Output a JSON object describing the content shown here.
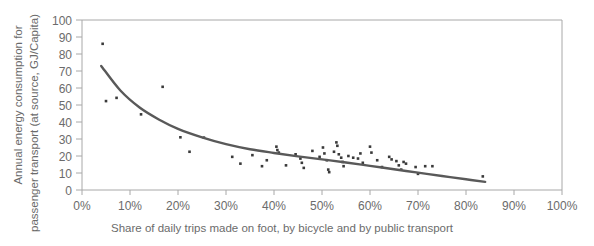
{
  "chart_data": {
    "type": "scatter",
    "title": "",
    "xlabel": "Share of daily trips made on foot, by bicycle and by public transport",
    "ylabel_line1": "Annual energy consumption for",
    "ylabel_line2": "passenger transport (at source, GJ/Capita)",
    "xlim": [
      0,
      100
    ],
    "ylim": [
      0,
      100
    ],
    "xticks": [
      0,
      10,
      20,
      30,
      40,
      50,
      60,
      70,
      80,
      90,
      100
    ],
    "xtick_labels": [
      "0%",
      "10%",
      "20%",
      "30%",
      "40%",
      "50%",
      "60%",
      "70%",
      "80%",
      "90%",
      "100%"
    ],
    "yticks": [
      0,
      10,
      20,
      30,
      40,
      50,
      60,
      70,
      80,
      90,
      100
    ],
    "ytick_labels": [
      "0",
      "10",
      "20",
      "30",
      "40",
      "50",
      "60",
      "70",
      "80",
      "90",
      "100"
    ],
    "grid": false,
    "legend": null,
    "point_color": "#3a3a3a",
    "trend_color": "#595959",
    "axis_color": "#a8a8a8",
    "points": [
      [
        4.3,
        86.0
      ],
      [
        5.0,
        52.3
      ],
      [
        7.2,
        54.2
      ],
      [
        12.3,
        44.5
      ],
      [
        16.8,
        60.7
      ],
      [
        20.5,
        31.0
      ],
      [
        22.4,
        22.5
      ],
      [
        25.4,
        30.8
      ],
      [
        31.3,
        19.5
      ],
      [
        33.0,
        15.5
      ],
      [
        35.5,
        20.5
      ],
      [
        37.5,
        14.0
      ],
      [
        38.5,
        17.5
      ],
      [
        40.5,
        25.5
      ],
      [
        40.7,
        23.5
      ],
      [
        41.0,
        22.0
      ],
      [
        42.5,
        14.5
      ],
      [
        44.5,
        21.0
      ],
      [
        45.5,
        18.5
      ],
      [
        45.8,
        16.0
      ],
      [
        46.2,
        13.0
      ],
      [
        48.0,
        23.0
      ],
      [
        49.5,
        19.5
      ],
      [
        50.2,
        25.0
      ],
      [
        50.5,
        21.5
      ],
      [
        51.0,
        17.5
      ],
      [
        51.3,
        12.0
      ],
      [
        51.5,
        10.5
      ],
      [
        52.5,
        22.5
      ],
      [
        53.0,
        28.0
      ],
      [
        53.2,
        26.0
      ],
      [
        53.5,
        21.0
      ],
      [
        54.0,
        19.0
      ],
      [
        54.3,
        16.5
      ],
      [
        54.5,
        14.0
      ],
      [
        55.5,
        20.0
      ],
      [
        56.5,
        19.0
      ],
      [
        57.5,
        18.5
      ],
      [
        58.0,
        21.5
      ],
      [
        58.5,
        16.0
      ],
      [
        60.0,
        25.5
      ],
      [
        60.3,
        22.0
      ],
      [
        61.5,
        17.5
      ],
      [
        62.5,
        13.5
      ],
      [
        64.0,
        19.5
      ],
      [
        64.5,
        18.0
      ],
      [
        65.5,
        17.0
      ],
      [
        66.0,
        14.5
      ],
      [
        66.5,
        12.0
      ],
      [
        67.0,
        16.5
      ],
      [
        67.5,
        15.5
      ],
      [
        69.5,
        13.5
      ],
      [
        70.0,
        9.5
      ],
      [
        71.5,
        14.0
      ],
      [
        73.0,
        14.0
      ],
      [
        83.5,
        8.0
      ]
    ],
    "trend_points": [
      [
        4.0,
        73.0
      ],
      [
        8.0,
        58.5
      ],
      [
        12.0,
        48.5
      ],
      [
        16.0,
        41.5
      ],
      [
        20.0,
        36.0
      ],
      [
        25.0,
        31.0
      ],
      [
        30.0,
        27.0
      ],
      [
        35.0,
        24.0
      ],
      [
        40.0,
        21.8
      ],
      [
        45.0,
        19.8
      ],
      [
        50.0,
        18.0
      ],
      [
        55.0,
        16.2
      ],
      [
        60.0,
        14.2
      ],
      [
        65.0,
        12.2
      ],
      [
        70.0,
        10.2
      ],
      [
        75.0,
        8.2
      ],
      [
        80.0,
        6.3
      ],
      [
        84.0,
        4.8
      ]
    ]
  }
}
